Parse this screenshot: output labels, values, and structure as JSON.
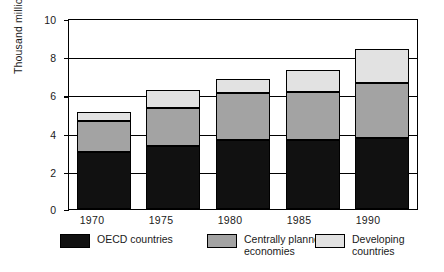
{
  "chart_data": {
    "type": "bar",
    "subtype": "stacked-bar",
    "title": "",
    "xlabel": "",
    "ylabel": "Thousand million toe",
    "ylim": [
      0,
      10
    ],
    "yticks": [
      0,
      2,
      4,
      6,
      8,
      10
    ],
    "ytick_labels": [
      "0",
      "2",
      "4",
      "6",
      "8",
      "10"
    ],
    "grid": true,
    "grid_axis": "y",
    "legend_position": "bottom",
    "categories": [
      "1970",
      "1975",
      "1980",
      "1985",
      "1990"
    ],
    "series": [
      {
        "name": "OECD countries",
        "color": "#111111",
        "values": [
          3.0,
          3.3,
          3.65,
          3.65,
          3.75
        ]
      },
      {
        "name": "Centrally planned economies",
        "color": "#a3a3a3",
        "values": [
          1.65,
          2.0,
          2.45,
          2.5,
          2.9
        ]
      },
      {
        "name": "Developing countries",
        "color": "#e2e2e2",
        "values": [
          0.45,
          0.95,
          0.75,
          1.15,
          1.75
        ]
      }
    ],
    "totals": [
      5.1,
      6.25,
      6.85,
      7.3,
      8.4
    ]
  },
  "axis": {
    "y_title": "Thousand million toe",
    "y_tick_0": "0",
    "y_tick_1": "2",
    "y_tick_2": "4",
    "y_tick_3": "6",
    "y_tick_4": "8",
    "y_tick_5": "10",
    "x_tick_0": "1970",
    "x_tick_1": "1975",
    "x_tick_2": "1980",
    "x_tick_3": "1985",
    "x_tick_4": "1990"
  },
  "legend": {
    "items": [
      {
        "label": "OECD countries"
      },
      {
        "label": "Centrally planned\neconomies"
      },
      {
        "label": "Developing\ncountries"
      }
    ]
  }
}
